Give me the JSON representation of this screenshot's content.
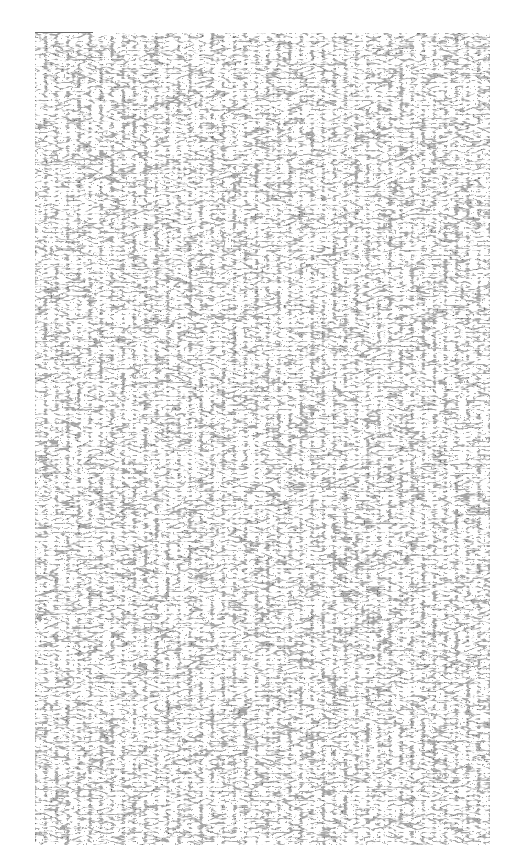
{
  "image": {
    "kind": "speckle-noise-texture",
    "background_color": "#ffffff",
    "ink_color": "#111111",
    "panel": {
      "x": 35,
      "y": 33,
      "width": 455,
      "height": 812
    },
    "dark_patches": [
      {
        "x": 110,
        "y": 110,
        "w": 220,
        "h": 60
      },
      {
        "x": 240,
        "y": 100,
        "w": 120,
        "h": 50
      },
      {
        "x": 420,
        "y": 360,
        "w": 60,
        "h": 120
      },
      {
        "x": 440,
        "y": 740,
        "w": 45,
        "h": 70
      },
      {
        "x": 60,
        "y": 200,
        "w": 40,
        "h": 50
      }
    ]
  }
}
